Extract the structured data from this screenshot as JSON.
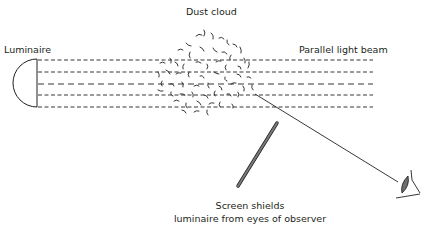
{
  "labels": {
    "luminaire": "Luminaire",
    "dust_cloud": "Dust cloud",
    "parallel_beam": "Parallel light beam",
    "screen_line1": "Screen shields",
    "screen_line2": "luminaire from eyes of observer"
  },
  "colors": {
    "stroke": "#231f20",
    "screen_fill": "#7a7a7a",
    "eye_fill": "#6d6d6d"
  },
  "beam": {
    "x_start": 38,
    "x_end": 373,
    "y_lines": [
      60,
      72,
      84,
      95,
      107
    ]
  }
}
